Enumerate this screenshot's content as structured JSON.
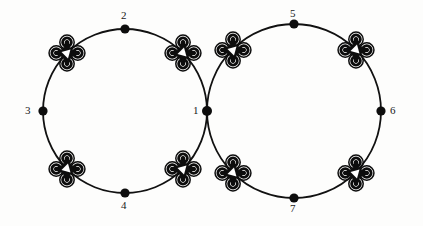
{
  "figure": {
    "background_color": "#fdfdfc",
    "stroke_color": "#111111",
    "node_color": "#0d0d0d",
    "label_color": "#191919",
    "path": {
      "type": "two-tangent-circles",
      "circles": [
        {
          "name": "left-circle",
          "cx": 125,
          "cy": 111,
          "r": 82,
          "stroke_width": 1.8
        },
        {
          "name": "right-circle",
          "cx": 294,
          "cy": 111,
          "r": 87,
          "stroke_width": 1.8
        }
      ],
      "tangent_point": {
        "x": 207,
        "y": 111
      }
    },
    "nodes": [
      {
        "id": "1",
        "label": "1",
        "x": 207,
        "y": 111,
        "r": 5.0,
        "label_x": 193,
        "label_y": 105,
        "label_anchor": "left"
      },
      {
        "id": "2",
        "label": "2",
        "x": 125,
        "y": 29,
        "r": 4.6,
        "label_x": 121,
        "label_y": 10,
        "label_anchor": "above"
      },
      {
        "id": "3",
        "label": "3",
        "x": 43,
        "y": 111,
        "r": 4.6,
        "label_x": 25,
        "label_y": 105,
        "label_anchor": "left"
      },
      {
        "id": "4",
        "label": "4",
        "x": 125,
        "y": 193,
        "r": 4.6,
        "label_x": 121,
        "label_y": 200,
        "label_anchor": "below"
      },
      {
        "id": "5",
        "label": "5",
        "x": 294,
        "y": 24,
        "r": 4.6,
        "label_x": 290,
        "label_y": 8,
        "label_anchor": "above"
      },
      {
        "id": "6",
        "label": "6",
        "x": 381,
        "y": 111,
        "r": 4.6,
        "label_x": 390,
        "label_y": 105,
        "label_anchor": "right"
      },
      {
        "id": "7",
        "label": "7",
        "x": 294,
        "y": 198,
        "r": 4.6,
        "label_x": 290,
        "label_y": 203,
        "label_anchor": "below"
      }
    ],
    "drones": [
      {
        "id": "drone-left-top-left",
        "x": 67,
        "y": 53,
        "rotation": -45,
        "scale": 1.0
      },
      {
        "id": "drone-left-top-right",
        "x": 183,
        "y": 53,
        "rotation": 45,
        "scale": 1.0
      },
      {
        "id": "drone-left-bottom-left",
        "x": 67,
        "y": 169,
        "rotation": 45,
        "scale": 1.0
      },
      {
        "id": "drone-left-bottom-right",
        "x": 183,
        "y": 169,
        "rotation": -45,
        "scale": 1.0
      },
      {
        "id": "drone-right-top-left",
        "x": 233,
        "y": 50,
        "rotation": -45,
        "scale": 1.0
      },
      {
        "id": "drone-right-top-right",
        "x": 356,
        "y": 50,
        "rotation": 45,
        "scale": 1.0
      },
      {
        "id": "drone-right-bottom-left",
        "x": 233,
        "y": 173,
        "rotation": 45,
        "scale": 1.0
      },
      {
        "id": "drone-right-bottom-right",
        "x": 356,
        "y": 173,
        "rotation": -45,
        "scale": 1.0
      }
    ],
    "drone_glyph": {
      "name": "quadcopter-icon",
      "rotor_count": 4,
      "rotor_ring_outer_r": 7.2,
      "rotor_ring_inner_r": 4.3,
      "rotor_hub_r": 2.1,
      "arm_offset": 7.6,
      "body_triangle_r": 5.6
    },
    "counts": {
      "nodes": 7,
      "drones": 8,
      "circles": 2
    }
  }
}
